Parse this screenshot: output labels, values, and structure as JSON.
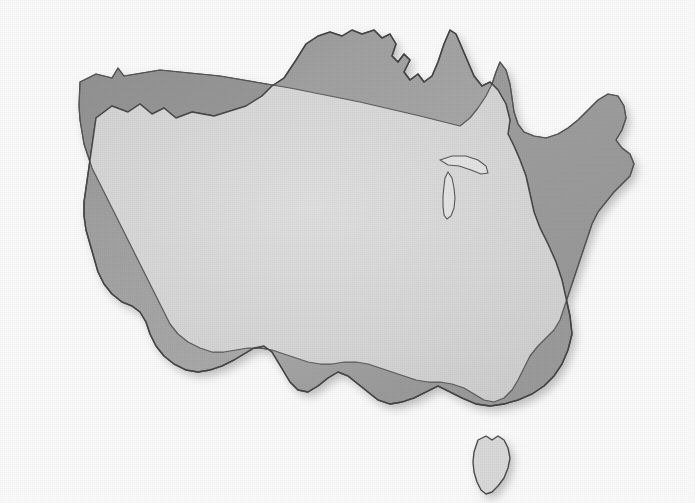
{
  "figure": {
    "kind": "map-overlay-comparison",
    "title": "",
    "caption": "",
    "background_color": "#fefefe",
    "width": 695,
    "height": 503,
    "has_visible_text": false
  },
  "style": {
    "australia_fill": "#9e9e9e",
    "usa_fill": "#9e9e9e",
    "overlap_fill": "#d8d8d8",
    "outline_color": "#4a4a4a",
    "outline_width": 1.3,
    "shadow_color": "#9a9a9a",
    "paper_color": "#fefefe",
    "tasmania_fill": "#dcdcdc"
  },
  "shapes": {
    "australia": {
      "name": "australia-mainland",
      "label": "Australia mainland outline",
      "fill": "#a1a1a1",
      "path": "M 96,118 L 112,106 L 128,112 L 140,104 L 152,114 L 164,108 L 176,118 L 192,112 L 214,116 L 246,106 L 262,96 L 272,86 L 284,78 L 296,60 L 306,44 L 318,36 L 330,32 L 342,36 L 352,30 L 362,34 L 374,30 L 382,38 L 390,34 L 396,44 L 392,56 L 398,62 L 404,54 L 410,60 L 404,72 L 410,80 L 418,74 L 424,82 L 432,76 L 438,62 L 444,44 L 450,30 L 456,34 L 462,48 L 468,62 L 474,76 L 482,86 L 490,82 L 498,90 L 506,104 L 510,120 L 508,134 L 514,146 L 520,160 L 526,176 L 530,194 L 534,212 L 540,228 L 548,244 L 556,262 L 562,280 L 566,298 L 570,316 L 572,334 L 568,350 L 562,364 L 554,376 L 544,386 L 532,394 L 518,400 L 504,404 L 490,406 L 476,404 L 462,398 L 450,392 L 438,386 L 426,392 L 414,398 L 402,402 L 390,404 L 378,400 L 368,392 L 358,384 L 348,376 L 338,372 L 328,378 L 318,386 L 308,392 L 298,390 L 290,382 L 284,372 L 278,362 L 272,352 L 264,346 L 254,348 L 244,354 L 234,360 L 222,366 L 210,370 L 198,372 L 186,370 L 174,364 L 164,356 L 156,346 L 150,334 L 146,322 L 140,312 L 132,306 L 122,302 L 112,294 L 104,284 L 98,272 L 94,258 L 90,244 L 86,230 L 84,216 L 84,202 L 86,188 L 88,174 L 90,160 L 92,146 L 94,132 Z"
    },
    "usa": {
      "name": "usa-contiguous",
      "label": "Contiguous United States outline",
      "fill": "#9c9c9c",
      "path": "M 80,82 L 96,74 L 112,78 L 118,68 L 124,76 L 160,70 L 220,76 L 290,88 L 360,102 L 420,116 L 460,126 L 470,118 L 478,108 L 486,96 L 492,84 L 496,72 L 500,62 L 506,70 L 510,84 L 512,98 L 514,112 L 518,124 L 524,132 L 534,136 L 546,138 L 558,134 L 568,128 L 578,120 L 588,110 L 598,100 L 608,94 L 618,96 L 624,106 L 626,118 L 622,130 L 616,140 L 622,148 L 630,154 L 634,164 L 630,176 L 622,184 L 614,192 L 606,202 L 598,212 L 592,224 L 588,236 L 584,248 L 580,260 L 576,272 L 572,284 L 568,296 L 564,308 L 560,320 L 554,330 L 546,338 L 538,346 L 530,356 L 524,368 L 518,380 L 512,390 L 504,398 L 494,402 L 484,400 L 474,394 L 464,388 L 452,384 L 440,382 L 428,382 L 416,380 L 404,376 L 392,372 L 380,368 L 368,364 L 356,362 L 344,362 L 332,364 L 320,364 L 308,362 L 296,358 L 284,354 L 272,350 L 260,348 L 248,348 L 236,350 L 224,352 L 212,352 L 200,348 L 188,342 L 178,334 L 170,324 L 164,312 L 158,300 L 152,288 L 146,276 L 140,264 L 134,252 L 128,240 L 122,228 L 116,216 L 110,204 L 104,192 L 98,180 L 92,168 L 88,156 L 84,144 L 82,132 L 80,120 L 79,106 Z"
    },
    "tasmania": {
      "name": "tasmania-island",
      "label": "Tasmania island outline",
      "fill": "#dcdcdc",
      "path": "M 478,440 L 486,436 L 492,440 L 498,436 L 504,440 L 508,448 L 510,458 L 508,468 L 504,478 L 498,486 L 492,492 L 486,494 L 481,490 L 477,482 L 474,472 L 473,462 L 474,452 Z"
    },
    "great_lakes": [
      {
        "name": "lake-michigan",
        "label": "Lake Michigan",
        "path": "M 448,172 L 452,178 L 454,188 L 455,198 L 454,208 L 451,216 L 447,219 L 444,215 L 443,206 L 443,196 L 444,186 L 445,178 Z"
      },
      {
        "name": "lake-superior-huron",
        "label": "Lake Superior / Huron",
        "path": "M 440,160 L 452,156 L 466,156 L 478,160 L 486,166 L 488,173 L 481,174 L 471,170 L 459,166 L 448,165 Z"
      }
    ]
  },
  "legend": {
    "visible": false,
    "entries": []
  }
}
